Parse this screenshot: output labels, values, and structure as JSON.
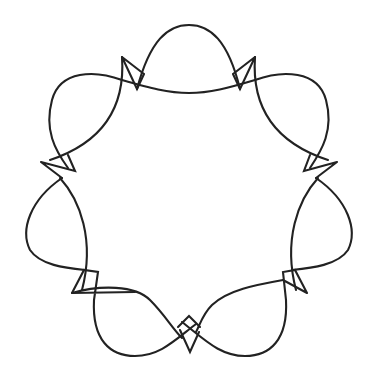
{
  "figure": {
    "description": "Closed decorative curve with eight lobes, each joined by small cusp-shaped triangular loops",
    "lobe_count": 8,
    "cusp_count": 8,
    "symmetry": "8-fold rotational",
    "stroke_color": "#222222",
    "background_color": "#ffffff"
  }
}
